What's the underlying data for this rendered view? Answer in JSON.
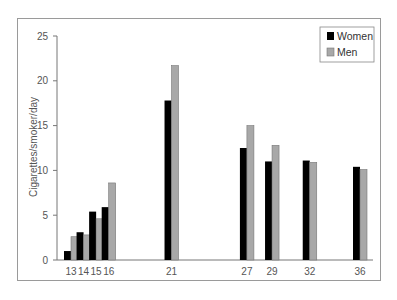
{
  "chart_data": {
    "type": "bar",
    "title": "",
    "xlabel": "",
    "ylabel": "Cigarettes/smoker/day",
    "ylim": [
      0,
      25
    ],
    "yticks": [
      0,
      5,
      10,
      15,
      20,
      25
    ],
    "grid": false,
    "legend_position": "upper right",
    "categories": [
      "13",
      "14",
      "15",
      "16",
      "21",
      "27",
      "29",
      "32",
      "36"
    ],
    "category_x_positions": [
      13,
      14,
      15,
      16,
      21,
      27,
      29,
      32,
      36
    ],
    "series": [
      {
        "name": "Women",
        "color": "#000000",
        "values": [
          1.0,
          3.1,
          5.4,
          5.9,
          17.8,
          12.5,
          11.0,
          11.1,
          10.4
        ]
      },
      {
        "name": "Men",
        "color": "#a8a8a8",
        "values": [
          2.6,
          2.8,
          4.6,
          8.6,
          21.7,
          15.0,
          12.8,
          10.9,
          10.1
        ]
      }
    ]
  },
  "legend": {
    "items": [
      {
        "label": "Women",
        "color": "#000000"
      },
      {
        "label": "Men",
        "color": "#a8a8a8"
      }
    ]
  }
}
